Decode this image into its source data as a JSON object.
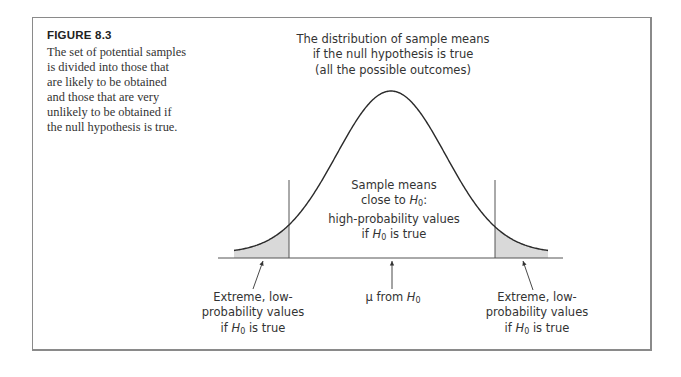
{
  "figure": {
    "label": "FIGURE 8.3",
    "caption": "The set of potential samples is divided into those that are likely to be obtained and those that are very unlikely to be obtained if the null hypothesis is true."
  },
  "labels": {
    "top": [
      "The distribution of sample means",
      "if the null hypothesis is true",
      "(all the possible outcomes)"
    ],
    "center": {
      "line1": "Sample means",
      "line2_prefix": "close to ",
      "line2_var": "H",
      "line2_sub": "0",
      "line2_suffix": ":",
      "line3": "high-probability values",
      "line4_prefix": "if ",
      "line4_var": "H",
      "line4_sub": "0",
      "line4_suffix": " is true"
    },
    "left_tail": {
      "line1": "Extreme, low-",
      "line2": "probability values",
      "line3_prefix": "if ",
      "line3_var": "H",
      "line3_sub": "0",
      "line3_suffix": " is true"
    },
    "mean": {
      "prefix": "μ from ",
      "var": "H",
      "sub": "0"
    },
    "right_tail": {
      "line1": "Extreme, low-",
      "line2": "probability values",
      "line3_prefix": "if ",
      "line3_var": "H",
      "line3_sub": "0",
      "line3_suffix": " is true"
    }
  },
  "colors": {
    "curve": "#2a2a2a",
    "shade": "#d9d9d9",
    "line": "#555555",
    "frame": "#8a8a8a"
  },
  "chart_data": {
    "type": "area",
    "title": "The distribution of sample means if the null hypothesis is true (all the possible outcomes)",
    "distribution": "normal",
    "mean_label": "μ from H0",
    "regions": [
      {
        "name": "left critical region",
        "description": "Extreme, low-probability values if H0 is true",
        "shaded": true
      },
      {
        "name": "center region",
        "description": "Sample means close to H0: high-probability values if H0 is true",
        "shaded": false
      },
      {
        "name": "right critical region",
        "description": "Extreme, low-probability values if H0 is true",
        "shaded": true
      }
    ],
    "geometry": {
      "center_x": 391,
      "baseline_y": 258,
      "amplitude": 162,
      "sigma": 54.5,
      "offset": 5,
      "curve_x_range": [
        234,
        548
      ],
      "baseline_x_range": [
        218,
        563
      ],
      "left_cutoff_x": 289,
      "right_cutoff_x": 495,
      "cutoff_top_y": 180
    },
    "xlabel": "",
    "ylabel": "",
    "grid": false
  }
}
